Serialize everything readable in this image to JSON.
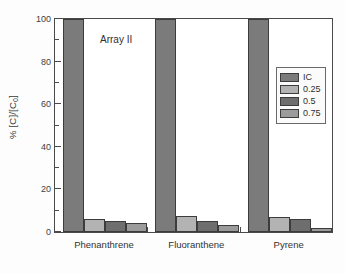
{
  "chart_data": {
    "type": "bar",
    "title": "",
    "annotation": "Array II",
    "xlabel": "",
    "ylabel": "% [C]/[C0]",
    "ylabel_prefix": "% [C]/[C",
    "ylabel_sub": "0",
    "ylabel_suffix": "]",
    "categories": [
      "Phenanthrene",
      "Fluoranthene",
      "Pyrene"
    ],
    "series": [
      {
        "name": "IC",
        "color": "#7b7b7b",
        "values": [
          100,
          100,
          100
        ]
      },
      {
        "name": "0.25",
        "color": "#b3b3b3",
        "values": [
          6,
          7.5,
          7
        ]
      },
      {
        "name": "0.5",
        "color": "#6e6e6e",
        "values": [
          5,
          5,
          6
        ]
      },
      {
        "name": "0.75",
        "color": "#9b9b9b",
        "values": [
          4,
          3.5,
          2
        ]
      }
    ],
    "ylim": [
      0,
      100
    ],
    "ytick_major": [
      0,
      20,
      40,
      60,
      80,
      100
    ],
    "ytick_minor": [
      10,
      30,
      50,
      70,
      90
    ],
    "ytick_labels": [
      "0",
      "20",
      "40",
      "60",
      "80",
      "100"
    ],
    "grid": false,
    "legend_position": "right-upper",
    "legend_entries": [
      "IC",
      "0.25",
      "0.5",
      "0.75"
    ],
    "axis_color": "#4a4a4a",
    "background": "#ffffff"
  }
}
